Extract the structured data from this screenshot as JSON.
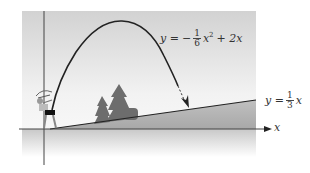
{
  "figure": {
    "parabola_label": {
      "lhs": "y =",
      "sign": "−",
      "frac_num": "1",
      "frac_den": "6",
      "term1": "x",
      "exp": "2",
      "rest": "+ 2x"
    },
    "line_label": {
      "lhs": "y =",
      "frac_num": "1",
      "frac_den": "3",
      "term": "x"
    },
    "x_axis_label": "x",
    "colors": {
      "panel_top": "#d4d4d4",
      "panel_mid": "#ececec",
      "ground": "#a8a8a8",
      "curve": "#222222",
      "tree": "#6d6d6d"
    }
  }
}
